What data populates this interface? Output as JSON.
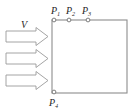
{
  "figure": {
    "background_color": "#ffffff",
    "width": 138,
    "height": 111
  },
  "flow": {
    "velocity_label": "V",
    "velocity_label_style": "italic",
    "direction": "left-to-right",
    "arrow_count": 3,
    "arrow_color": "#9a9a9a",
    "arrows": [
      {
        "name": "flow-arrow-1",
        "x": 6,
        "y": 31,
        "length": 42,
        "thickness": 11
      },
      {
        "name": "flow-arrow-2",
        "x": 6,
        "y": 53,
        "length": 42,
        "thickness": 11
      },
      {
        "name": "flow-arrow-3",
        "x": 6,
        "y": 75,
        "length": 42,
        "thickness": 11
      }
    ]
  },
  "body": {
    "name": "rectangular-body",
    "x": 52,
    "y": 20,
    "width": 75,
    "height": 73,
    "stroke_color": "#8d8d8d",
    "fill_color": "#ffffff"
  },
  "points": [
    {
      "id": "P1",
      "base": "P",
      "sub": "1",
      "cx": 54,
      "cy": 20,
      "label_x": 51,
      "label_y": 13
    },
    {
      "id": "P2",
      "base": "P",
      "sub": "2",
      "cx": 69,
      "cy": 20,
      "label_x": 66,
      "label_y": 13
    },
    {
      "id": "P3",
      "base": "P",
      "sub": "3",
      "cx": 88,
      "cy": 20,
      "label_x": 79,
      "label_y": 13
    },
    {
      "id": "P4",
      "base": "P",
      "sub": "4",
      "cx": 54,
      "cy": 92,
      "label_x": 50,
      "label_y": 107
    }
  ],
  "colors": {
    "line": "#8d8d8d",
    "marker_stroke": "#6f6f6f",
    "text": "#1f1f1f",
    "arrow_stroke": "#9a9a9a"
  }
}
